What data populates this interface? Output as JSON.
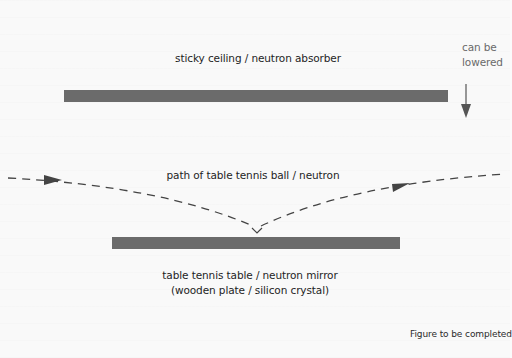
{
  "diagram": {
    "ceiling_label": "sticky ceiling / neutron absorber",
    "lower_label_line1": "can be",
    "lower_label_line2": "lowered",
    "path_label": "path of table tennis ball / neutron",
    "table_label_line1": "table tennis table / neutron mirror",
    "table_label_line2": "(wooden plate / silicon crystal)",
    "caption": "Figure to be completed",
    "colors": {
      "bar": "#6b6b6b",
      "path": "#444444",
      "text": "#1e1e1e",
      "muted_text": "#6a6a6a",
      "background": "#f9f9f9"
    }
  }
}
